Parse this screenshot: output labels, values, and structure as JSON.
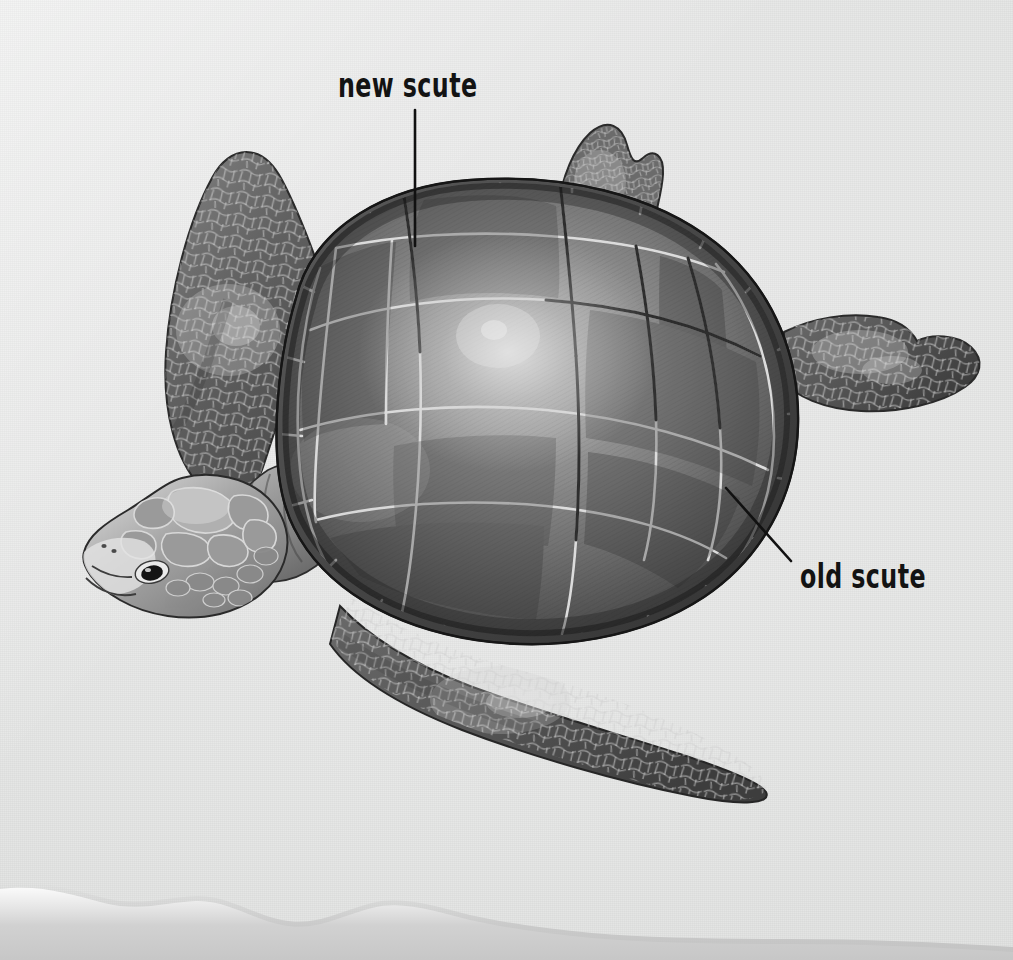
{
  "figure": {
    "style": "grayscale scientific illustration on textured paper",
    "background_color": "#e6e7e6",
    "ink_color": "#131313"
  },
  "annotations": [
    {
      "id": "new-scute",
      "label": "new scute",
      "leader": {
        "type": "vertical",
        "from_x": 415,
        "from_y": 110,
        "to_x": 415,
        "to_y": 246
      },
      "points_to": "central vertebral scute near front of carapace"
    },
    {
      "id": "old-scute",
      "label": "old scute",
      "leader": {
        "type": "diagonal",
        "from_x": 726,
        "from_y": 488,
        "to_x": 791,
        "to_y": 561
      },
      "points_to": "marginal scute on right rear rim of carapace"
    }
  ],
  "anatomy": {
    "carapace_label": "carapace",
    "head_label": "head",
    "front_flipper_upper_label": "front flipper",
    "front_flipper_lower_label": "front flipper",
    "rear_flipper_upper_label": "rear flipper",
    "rear_flipper_right_label": "rear flipper"
  },
  "palette": {
    "paper": "#e6e7e6",
    "shell_mid": "#8d8d8d",
    "shell_dark": "#4e4e4e",
    "shell_darkest": "#3a3a3a",
    "shell_light": "#b4b4b4",
    "highlight": "#d7d7d7",
    "scute_outline": "#d9d9d9",
    "outline_dark": "#1e1e1e",
    "flipper": "#5a5a5a",
    "head_light": "#cfcfcf"
  },
  "page_edge": {
    "present": true,
    "description": "torn deckled bottom paper edge with soft drop shadow",
    "shadow_color": "#cccccc"
  }
}
